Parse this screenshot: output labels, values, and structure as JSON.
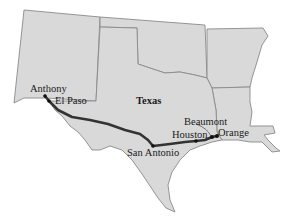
{
  "map": {
    "title": "Texas",
    "route_color": "#333333",
    "land_color": "#d9d9d9",
    "border_color": "#8a8a8a",
    "labels": {
      "state": "Texas",
      "anthony": "Anthony",
      "el_paso": "El Paso",
      "san_antonio": "San Antonio",
      "houston": "Houston",
      "beaumont": "Beaumont",
      "orange": "Orange"
    },
    "cities": [
      {
        "name": "Anthony",
        "x": 45,
        "y": 96
      },
      {
        "name": "El Paso",
        "x": 49,
        "y": 101
      },
      {
        "name": "San Antonio",
        "x": 153,
        "y": 146
      },
      {
        "name": "Houston",
        "x": 196,
        "y": 141
      },
      {
        "name": "Beaumont",
        "x": 212,
        "y": 137
      },
      {
        "name": "Orange",
        "x": 217,
        "y": 136
      }
    ]
  }
}
